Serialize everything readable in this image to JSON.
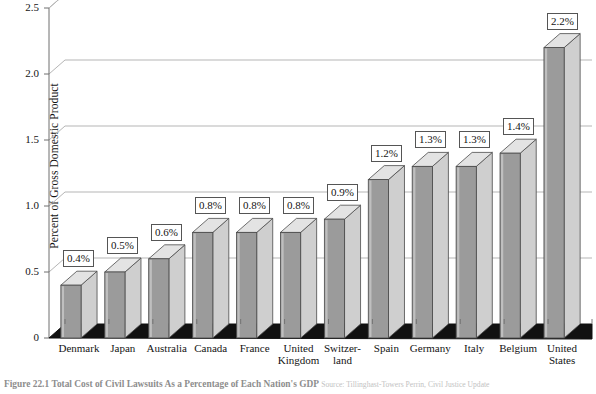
{
  "chart_data": {
    "type": "bar",
    "title": "",
    "xlabel": "",
    "ylabel": "Percent of Gross Domestic Product",
    "ylim": [
      0,
      2.5
    ],
    "yticks": [
      0,
      0.5,
      1.0,
      1.5,
      2.0,
      2.5
    ],
    "ytick_labels": [
      "0",
      "0.5",
      "1.0",
      "1.5",
      "2.0",
      "2.5"
    ],
    "grid": true,
    "legend": "none",
    "style": "3d-column",
    "categories": [
      "Denmark",
      "Japan",
      "Australia",
      "Canada",
      "France",
      "United\nKingdom",
      "Switzer-\nland",
      "Spain",
      "Germany",
      "Italy",
      "Belgium",
      "United\nStates"
    ],
    "values": [
      0.4,
      0.5,
      0.6,
      0.8,
      0.8,
      0.8,
      0.9,
      1.2,
      1.3,
      1.3,
      1.4,
      2.2
    ],
    "data_labels": [
      "0.4%",
      "0.5%",
      "0.6%",
      "0.8%",
      "0.8%",
      "0.8%",
      "0.9%",
      "1.2%",
      "1.3%",
      "1.3%",
      "1.4%",
      "2.2%"
    ]
  },
  "caption": {
    "figure_number": "Figure 22.1",
    "title": "Total Cost of Civil Lawsuits As a Percentage of Each Nation's GDP",
    "source": "Source: Tillinghast-Towers Perrin, Civil Justice Update"
  },
  "colors": {
    "bar_front": "#9b9b9b",
    "bar_side": "#cfcfcf",
    "bar_top": "#e3e3e3",
    "bar_outline": "#4a4a4a",
    "floor": "#111111",
    "gridline": "#b5b5b5",
    "axis": "#6e6e6e",
    "text": "#141414",
    "callout_border": "#555555"
  }
}
